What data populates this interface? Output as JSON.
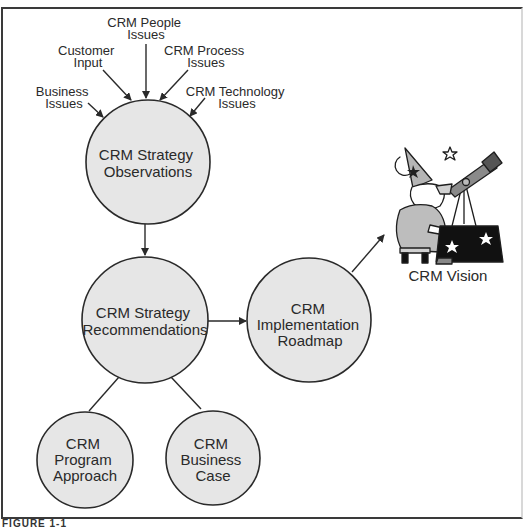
{
  "diagram": {
    "inputs": [
      {
        "id": "business",
        "lines": [
          "Business",
          "Issues"
        ]
      },
      {
        "id": "customer",
        "lines": [
          "Customer",
          "Input"
        ]
      },
      {
        "id": "people",
        "lines": [
          "CRM People",
          "Issues"
        ]
      },
      {
        "id": "process",
        "lines": [
          "CRM Process",
          "Issues"
        ]
      },
      {
        "id": "technology",
        "lines": [
          "CRM Technology",
          "Issues"
        ]
      }
    ],
    "nodes": [
      {
        "id": "observations",
        "lines": [
          "CRM Strategy",
          "Observations"
        ]
      },
      {
        "id": "recommendations",
        "lines": [
          "CRM Strategy",
          "Recommendations"
        ]
      },
      {
        "id": "roadmap",
        "lines": [
          "CRM",
          "Implementation",
          "Roadmap"
        ]
      },
      {
        "id": "program",
        "lines": [
          "CRM",
          "Program",
          "Approach"
        ]
      },
      {
        "id": "business_case",
        "lines": [
          "CRM",
          "Business",
          "Case"
        ]
      }
    ],
    "vision": {
      "label": "CRM Vision",
      "illustration": "wizard-with-telescope-icon"
    },
    "edges": [
      {
        "from": "business",
        "to": "observations",
        "type": "arrow"
      },
      {
        "from": "customer",
        "to": "observations",
        "type": "arrow"
      },
      {
        "from": "people",
        "to": "observations",
        "type": "arrow"
      },
      {
        "from": "process",
        "to": "observations",
        "type": "arrow"
      },
      {
        "from": "technology",
        "to": "observations",
        "type": "arrow"
      },
      {
        "from": "observations",
        "to": "recommendations",
        "type": "arrow"
      },
      {
        "from": "recommendations",
        "to": "roadmap",
        "type": "arrow"
      },
      {
        "from": "roadmap",
        "to": "vision",
        "type": "arrow"
      },
      {
        "from": "recommendations",
        "to": "program",
        "type": "line"
      },
      {
        "from": "recommendations",
        "to": "business_case",
        "type": "line"
      }
    ],
    "colors": {
      "node_fill": "#e6e6e6",
      "stroke": "#2a2a2a",
      "background": "#ffffff"
    }
  },
  "caption": "FIGURE 1-1"
}
